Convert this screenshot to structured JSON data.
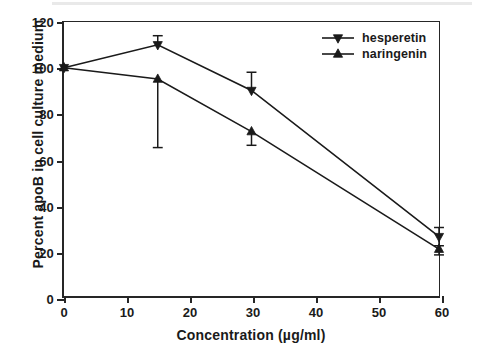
{
  "chart_data": {
    "type": "line",
    "title": "",
    "xlabel": "Concentration (µg/ml)",
    "ylabel": "Percent apoB in cell culture medium",
    "xlim": [
      0,
      60
    ],
    "ylim": [
      0,
      120
    ],
    "xticks": [
      0,
      10,
      20,
      30,
      40,
      50,
      60
    ],
    "yticks": [
      0,
      20,
      40,
      60,
      80,
      100,
      120
    ],
    "xtick_labels": [
      "0",
      "10",
      "20",
      "30",
      "40",
      "50",
      "60"
    ],
    "ytick_labels": [
      "0",
      "20",
      "40",
      "60",
      "80",
      "100",
      "120"
    ],
    "grid": false,
    "legend_position": "top-right",
    "x": [
      0,
      15,
      30,
      60
    ],
    "series": [
      {
        "name": "hesperetin",
        "marker": "triangle-down",
        "color": "#1a1a1a",
        "values": [
          100,
          110,
          90,
          26
        ],
        "err_low": [
          0,
          110,
          90,
          22
        ],
        "err_high": [
          0,
          114,
          98,
          30
        ]
      },
      {
        "name": "naringenin",
        "marker": "triangle-up",
        "color": "#1a1a1a",
        "values": [
          100,
          95,
          72,
          20.5
        ],
        "err_low": [
          0,
          65,
          66,
          18
        ],
        "err_high": [
          0,
          95,
          72,
          20.5
        ]
      }
    ]
  },
  "legend": {
    "items": [
      {
        "label": "hesperetin",
        "marker": "triangle-down-icon"
      },
      {
        "label": "naringenin",
        "marker": "triangle-up-icon"
      }
    ]
  }
}
